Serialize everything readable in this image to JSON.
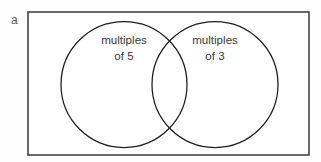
{
  "figure": {
    "part_label": "a",
    "background_color": "#fefefe",
    "universe": {
      "name": "universal-set-rectangle",
      "x": 28,
      "y": 12,
      "width": 281,
      "height": 143,
      "stroke_color": "#444444",
      "fill_color": "#ffffff"
    },
    "sets": [
      {
        "id": "multiples-of-5",
        "label_line1": "multiples",
        "label_line2": "of 5",
        "cx": 124,
        "cy": 84.5,
        "r": 63,
        "label_x": 124,
        "label_y1": 44,
        "label_y2": 60,
        "stroke_color": "#1d1d1d"
      },
      {
        "id": "multiples-of-3",
        "label_line1": "multiples",
        "label_line2": "of 3",
        "cx": 215,
        "cy": 84.5,
        "r": 63,
        "label_x": 215,
        "label_y1": 44,
        "label_y2": 60,
        "stroke_color": "#1d1d1d"
      }
    ],
    "text_color": "#3a3a3a"
  }
}
